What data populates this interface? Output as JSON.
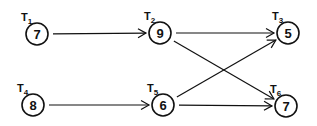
{
  "diagram": {
    "type": "task-precedence-graph",
    "nodes": [
      {
        "id": "T1",
        "label": "T",
        "sub": "1",
        "value": "7",
        "cx": 37,
        "cy": 34
      },
      {
        "id": "T2",
        "label": "T",
        "sub": "2",
        "value": "9",
        "cx": 160,
        "cy": 33
      },
      {
        "id": "T3",
        "label": "T",
        "sub": "3",
        "value": "5",
        "cx": 288,
        "cy": 33
      },
      {
        "id": "T4",
        "label": "T",
        "sub": "4",
        "value": "8",
        "cx": 33,
        "cy": 105
      },
      {
        "id": "T5",
        "label": "T",
        "sub": "5",
        "value": "6",
        "cx": 163,
        "cy": 105
      },
      {
        "id": "T6",
        "label": "T",
        "sub": "6",
        "value": "7",
        "cx": 286,
        "cy": 106
      }
    ],
    "edges": [
      {
        "from": "T1",
        "to": "T2"
      },
      {
        "from": "T2",
        "to": "T3"
      },
      {
        "from": "T2",
        "to": "T6"
      },
      {
        "from": "T4",
        "to": "T5"
      },
      {
        "from": "T5",
        "to": "T3"
      },
      {
        "from": "T5",
        "to": "T6"
      }
    ],
    "colors": {
      "stroke": "#111111",
      "background": "#ffffff"
    }
  }
}
